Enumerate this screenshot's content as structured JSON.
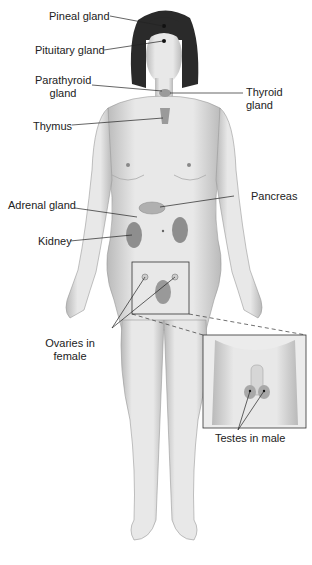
{
  "figure": {
    "labels": {
      "pineal": "Pineal gland",
      "pituitary": "Pituitary gland",
      "parathyroid_1": "Parathyroid",
      "parathyroid_2": "gland",
      "thyroid_1": "Thyroid",
      "thyroid_2": "gland",
      "thymus": "Thymus",
      "adrenal": "Adrenal gland",
      "pancreas": "Pancreas",
      "kidney": "Kidney",
      "ovaries_1": "Ovaries in",
      "ovaries_2": "female",
      "testes": "Testes in male"
    },
    "colors": {
      "skin": "#e6e6e6",
      "skin_shadow": "#b8b8b8",
      "hair": "#2a2a2a",
      "organ": "#9a9a9a",
      "line": "#222222"
    }
  }
}
